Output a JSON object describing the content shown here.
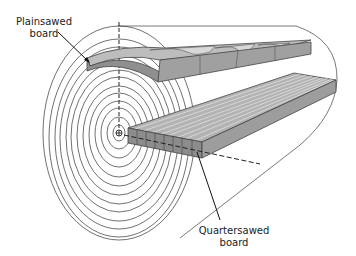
{
  "diagram": {
    "labels": {
      "plainsawed": {
        "line1": "Plainsawed",
        "line2": "board"
      },
      "quartersawed": {
        "line1": "Quartersawed",
        "line2": "board"
      }
    },
    "colors": {
      "ring_stroke": "#333333",
      "board_top": "#b9b9b9",
      "board_front": "#8f8f8f",
      "board_side": "#a3a3a3",
      "figure_light": "#d6d6d6",
      "outline": "#444444",
      "background": "#ffffff"
    },
    "log": {
      "pith_center": [
        119,
        133
      ],
      "ring_count": 13,
      "outer_ring_radii": [
        76,
        107
      ]
    },
    "icons": {
      "pith_marker": "circled-plus"
    }
  }
}
